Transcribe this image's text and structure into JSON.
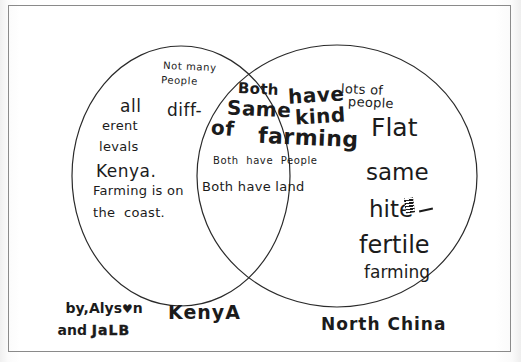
{
  "document": {
    "type": "hand-drawn Venn diagram worksheet",
    "title_note": "Comparison of Kenya and North China"
  },
  "labels": {
    "left_circle": "KenyA",
    "right_circle": "North China"
  },
  "left_only": [
    {
      "id": "not-many-people",
      "text_line1": "Not many",
      "text_line2": "People"
    },
    {
      "id": "all-different-levels",
      "text_line1": "all",
      "text_line2": "diff-",
      "text_line3": "erent",
      "text_line4": "levals"
    },
    {
      "id": "kenya-farming-coast",
      "text_line1": "Kenya.",
      "text_line2": "Farming is on",
      "text_line3": "the  coast."
    }
  ],
  "overlap": {
    "headline_words": [
      "Both",
      "have",
      "Same",
      "kind",
      "of",
      "farming"
    ],
    "headline_reading": "Both have Same kind of farming",
    "note_1": "Both  have  People",
    "note_2": "Both have land"
  },
  "right_only": [
    {
      "id": "lots-of-people",
      "text_line1": "lots of",
      "text_line2": "people"
    },
    {
      "id": "flat",
      "text": "Flat"
    },
    {
      "id": "same",
      "text": "same"
    },
    {
      "id": "hite-struck",
      "text": "hite",
      "strikeout_mark": "scribbled block",
      "dash": "-"
    },
    {
      "id": "fertile",
      "text": "fertile"
    },
    {
      "id": "farming",
      "text": "farming"
    }
  ],
  "signature": {
    "line1_prefix": "by,Alys",
    "line1_heart": "♥",
    "line1_suffix": "n",
    "line2_prefix": "and ",
    "line2_name": "JaLB"
  },
  "colors": {
    "ink": "#1b1b1b",
    "frame": "#8a8a8a",
    "paper": "#ffffff"
  }
}
